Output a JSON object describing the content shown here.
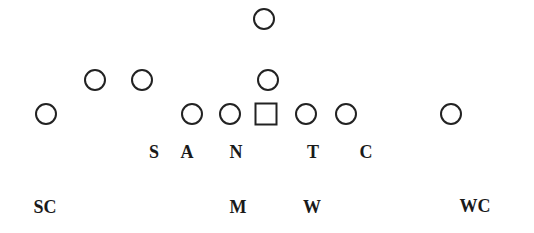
{
  "diagram": {
    "title": "",
    "stroke_color": "#222222",
    "label_color": "#1a1a1a",
    "offense": [
      {
        "id": "qb-deep",
        "shape": "circle",
        "x": 264,
        "y": 19
      },
      {
        "id": "back-left-1",
        "shape": "circle",
        "x": 95,
        "y": 80
      },
      {
        "id": "back-left-2",
        "shape": "circle",
        "x": 142,
        "y": 80
      },
      {
        "id": "qb",
        "shape": "circle",
        "x": 268,
        "y": 80
      },
      {
        "id": "wide-left",
        "shape": "circle",
        "x": 46,
        "y": 114
      },
      {
        "id": "line-1",
        "shape": "circle",
        "x": 192,
        "y": 114
      },
      {
        "id": "line-2",
        "shape": "circle",
        "x": 230,
        "y": 114
      },
      {
        "id": "center",
        "shape": "square",
        "x": 266,
        "y": 114
      },
      {
        "id": "line-4",
        "shape": "circle",
        "x": 306,
        "y": 114
      },
      {
        "id": "line-5",
        "shape": "circle",
        "x": 346,
        "y": 114
      },
      {
        "id": "wide-right",
        "shape": "circle",
        "x": 451,
        "y": 114
      }
    ],
    "defense_labels": [
      {
        "text": "S",
        "x": 154,
        "y": 152
      },
      {
        "text": "A",
        "x": 187,
        "y": 152
      },
      {
        "text": "N",
        "x": 236,
        "y": 152
      },
      {
        "text": "T",
        "x": 313,
        "y": 152
      },
      {
        "text": "C",
        "x": 366,
        "y": 152
      },
      {
        "text": "SC",
        "x": 45,
        "y": 207
      },
      {
        "text": "M",
        "x": 238,
        "y": 207
      },
      {
        "text": "W",
        "x": 312,
        "y": 207
      },
      {
        "text": "WC",
        "x": 475,
        "y": 206
      }
    ]
  }
}
